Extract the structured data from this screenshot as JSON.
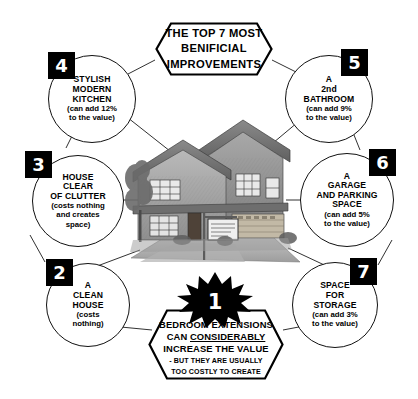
{
  "title": {
    "line1": "THE TOP 7 MOST",
    "line2": "BENIFICIAL",
    "line3": "IMPROVEMENTS"
  },
  "center_image": {
    "alt": "house-illustration"
  },
  "colors": {
    "badge_bg": "#000000",
    "badge_text": "#ffffff",
    "outline": "#111111",
    "background": "#ffffff"
  },
  "item1": {
    "number": "1",
    "line1": "BEDROOM  EXTENSIONS",
    "line2_a": "CAN ",
    "line2_b": "CONSIDERABLY",
    "line3": "INCREASE THE VALUE",
    "note1": "- BUT THEY ARE USUALLY",
    "note2": "TOO COSTLY TO CREATE"
  },
  "items": [
    {
      "number": "2",
      "head1": "A",
      "head2": "CLEAN",
      "head3": "HOUSE",
      "sub1": "(costs",
      "sub2": "nothing)"
    },
    {
      "number": "3",
      "head1": "HOUSE",
      "head2": "CLEAR",
      "head3": "OF CLUTTER",
      "sub1": "(costs nothing",
      "sub2": "and creates",
      "sub3": "space)"
    },
    {
      "number": "4",
      "head1": "STYLISH",
      "head2": "MODERN",
      "head3": "KITCHEN",
      "sub1": "(can add 12%",
      "sub2": "to the value)"
    },
    {
      "number": "5",
      "head1": "A",
      "head2": "2nd",
      "head3": "BATHROOM",
      "sub1": "(can add 9%",
      "sub2": "to the value)"
    },
    {
      "number": "6",
      "head1": "A",
      "head2": "GARAGE",
      "head3": "AND PARKING",
      "head4": "SPACE",
      "sub1": "(can add 5%",
      "sub2": "to the value)"
    },
    {
      "number": "7",
      "head1": "SPACE",
      "head2": "FOR",
      "head3": "STORAGE",
      "sub1": "(can add 3%",
      "sub2": "to the value)"
    }
  ]
}
